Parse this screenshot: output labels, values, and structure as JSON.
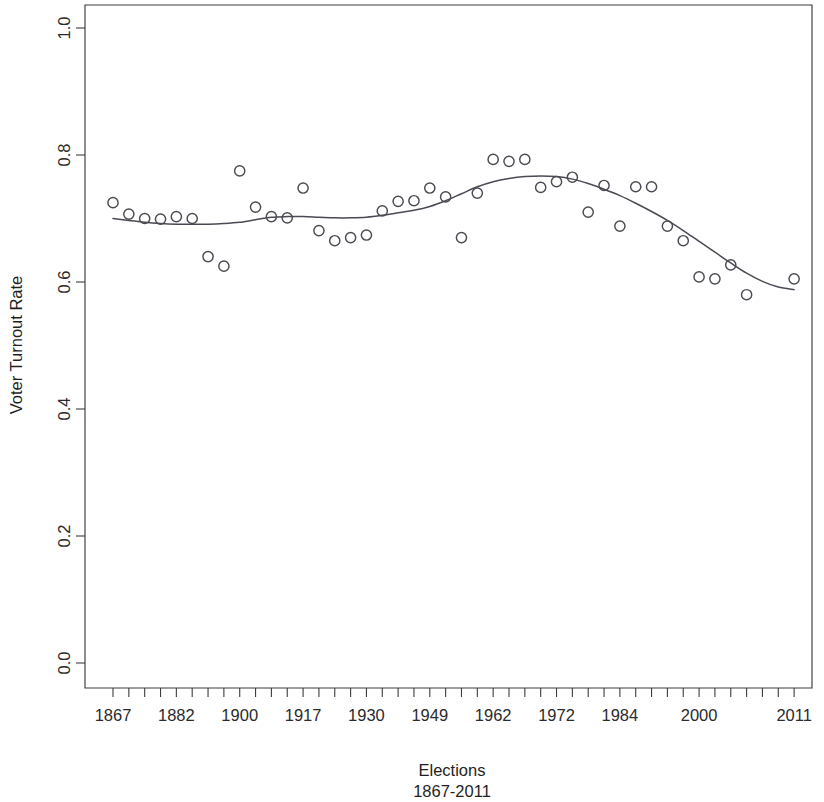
{
  "chart_data": {
    "type": "scatter",
    "title": "",
    "subtitle": "",
    "xlabel": "Elections",
    "xlabel_line2": "1867-2011",
    "ylabel": "Voter Turnout Rate",
    "grid": false,
    "legend": "none",
    "ylim": [
      0.0,
      1.0
    ],
    "ytick_labels": [
      "0.0",
      "0.2",
      "0.4",
      "0.6",
      "0.8",
      "1.0"
    ],
    "ytick_values": [
      0.0,
      0.2,
      0.4,
      0.6,
      0.8,
      1.0
    ],
    "xtick_labels": [
      "1867",
      "1882",
      "1900",
      "1917",
      "1930",
      "1949",
      "1962",
      "1972",
      "1984",
      "2000",
      "2011"
    ],
    "xtick_label_indices": [
      0,
      4,
      8,
      12,
      16,
      20,
      24,
      28,
      32,
      37,
      43
    ],
    "xtick_count": 44,
    "xlim_indices": [
      -0.6,
      43.6
    ],
    "marker": "open-circle",
    "marker_color": "#4a4a52",
    "curve_color": "#4a4a55",
    "curve_type": "loess-smooth",
    "x": [
      0,
      1,
      2,
      3,
      4,
      5,
      6,
      7,
      8,
      9,
      10,
      11,
      12,
      13,
      14,
      15,
      16,
      17,
      18,
      19,
      20,
      21,
      22,
      23,
      24,
      25,
      26,
      27,
      28,
      29,
      30,
      31,
      32,
      33,
      34,
      35,
      36,
      37,
      38,
      39,
      40,
      41,
      42,
      43
    ],
    "years": [
      "1867",
      "1872",
      "1874",
      "1878",
      "1882",
      "1887",
      "1891",
      "1896",
      "1900",
      "1904",
      "1908",
      "1911",
      "1917",
      "1921",
      "1925",
      "1926",
      "1930",
      "1935",
      "1940",
      "1945",
      "1949",
      "1953",
      "1957",
      "1958",
      "1962",
      "1963",
      "1965",
      "1968",
      "1972",
      "1974",
      "1979",
      "1980",
      "1984",
      "1988",
      "1993",
      "1997",
      "2000",
      "2004",
      "2006",
      "2008",
      "2011",
      "2011b",
      "2011c",
      "2011d"
    ],
    "values": [
      0.725,
      0.707,
      0.7,
      0.699,
      0.703,
      0.7,
      0.64,
      0.625,
      0.775,
      0.718,
      0.703,
      0.701,
      0.748,
      0.681,
      0.665,
      0.67,
      0.674,
      0.712,
      0.727,
      0.728,
      0.748,
      0.734,
      0.67,
      0.74,
      0.793,
      0.79,
      0.793,
      0.749,
      0.758,
      0.765,
      0.71,
      0.752,
      0.688,
      0.75,
      0.75,
      0.688,
      0.665,
      0.608,
      0.605,
      0.627,
      0.58,
      0.605,
      0.605,
      0.605
    ],
    "points": [
      {
        "ix": 0,
        "value": 0.725
      },
      {
        "ix": 1,
        "value": 0.707
      },
      {
        "ix": 2,
        "value": 0.7
      },
      {
        "ix": 3,
        "value": 0.699
      },
      {
        "ix": 4,
        "value": 0.703
      },
      {
        "ix": 5,
        "value": 0.7
      },
      {
        "ix": 6,
        "value": 0.64
      },
      {
        "ix": 7,
        "value": 0.625
      },
      {
        "ix": 8,
        "value": 0.775
      },
      {
        "ix": 9,
        "value": 0.718
      },
      {
        "ix": 10,
        "value": 0.703
      },
      {
        "ix": 11,
        "value": 0.701
      },
      {
        "ix": 12,
        "value": 0.748
      },
      {
        "ix": 13,
        "value": 0.681
      },
      {
        "ix": 14,
        "value": 0.665
      },
      {
        "ix": 15,
        "value": 0.67
      },
      {
        "ix": 16,
        "value": 0.674
      },
      {
        "ix": 17,
        "value": 0.712
      },
      {
        "ix": 18,
        "value": 0.727
      },
      {
        "ix": 19,
        "value": 0.728
      },
      {
        "ix": 20,
        "value": 0.748
      },
      {
        "ix": 21,
        "value": 0.734
      },
      {
        "ix": 22,
        "value": 0.67
      },
      {
        "ix": 23,
        "value": 0.74
      },
      {
        "ix": 24,
        "value": 0.793
      },
      {
        "ix": 25,
        "value": 0.79
      },
      {
        "ix": 26,
        "value": 0.793
      },
      {
        "ix": 27,
        "value": 0.749
      },
      {
        "ix": 28,
        "value": 0.758
      },
      {
        "ix": 29,
        "value": 0.765
      },
      {
        "ix": 30,
        "value": 0.71
      },
      {
        "ix": 31,
        "value": 0.752
      },
      {
        "ix": 32,
        "value": 0.688
      },
      {
        "ix": 33,
        "value": 0.75
      },
      {
        "ix": 34,
        "value": 0.75
      },
      {
        "ix": 35,
        "value": 0.688
      },
      {
        "ix": 36,
        "value": 0.665
      },
      {
        "ix": 37,
        "value": 0.608
      },
      {
        "ix": 38,
        "value": 0.605
      },
      {
        "ix": 39,
        "value": 0.627
      },
      {
        "ix": 40,
        "value": 0.58
      },
      {
        "ix": 43,
        "value": 0.605
      }
    ],
    "curve": [
      {
        "ix": 0,
        "value": 0.7
      },
      {
        "ix": 1,
        "value": 0.697
      },
      {
        "ix": 2,
        "value": 0.694
      },
      {
        "ix": 3,
        "value": 0.692
      },
      {
        "ix": 4,
        "value": 0.691
      },
      {
        "ix": 5,
        "value": 0.691
      },
      {
        "ix": 6,
        "value": 0.691
      },
      {
        "ix": 7,
        "value": 0.692
      },
      {
        "ix": 8,
        "value": 0.694
      },
      {
        "ix": 9,
        "value": 0.698
      },
      {
        "ix": 10,
        "value": 0.702
      },
      {
        "ix": 11,
        "value": 0.703
      },
      {
        "ix": 12,
        "value": 0.703
      },
      {
        "ix": 13,
        "value": 0.702
      },
      {
        "ix": 14,
        "value": 0.701
      },
      {
        "ix": 15,
        "value": 0.701
      },
      {
        "ix": 16,
        "value": 0.702
      },
      {
        "ix": 17,
        "value": 0.705
      },
      {
        "ix": 18,
        "value": 0.709
      },
      {
        "ix": 19,
        "value": 0.713
      },
      {
        "ix": 20,
        "value": 0.719
      },
      {
        "ix": 21,
        "value": 0.728
      },
      {
        "ix": 22,
        "value": 0.739
      },
      {
        "ix": 23,
        "value": 0.75
      },
      {
        "ix": 24,
        "value": 0.758
      },
      {
        "ix": 25,
        "value": 0.763
      },
      {
        "ix": 26,
        "value": 0.766
      },
      {
        "ix": 27,
        "value": 0.767
      },
      {
        "ix": 28,
        "value": 0.766
      },
      {
        "ix": 29,
        "value": 0.762
      },
      {
        "ix": 30,
        "value": 0.755
      },
      {
        "ix": 31,
        "value": 0.746
      },
      {
        "ix": 32,
        "value": 0.736
      },
      {
        "ix": 33,
        "value": 0.724
      },
      {
        "ix": 34,
        "value": 0.711
      },
      {
        "ix": 35,
        "value": 0.697
      },
      {
        "ix": 36,
        "value": 0.681
      },
      {
        "ix": 37,
        "value": 0.664
      },
      {
        "ix": 38,
        "value": 0.647
      },
      {
        "ix": 39,
        "value": 0.63
      },
      {
        "ix": 40,
        "value": 0.614
      },
      {
        "ix": 41,
        "value": 0.601
      },
      {
        "ix": 42,
        "value": 0.592
      },
      {
        "ix": 43,
        "value": 0.588
      }
    ]
  }
}
